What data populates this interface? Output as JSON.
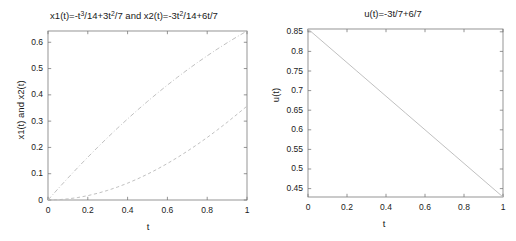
{
  "figure": {
    "background": "#ffffff",
    "axis_color": "#7a7a7a",
    "curve_color": "#b9b9b9",
    "text_color": "#1a1a1a"
  },
  "chart_data": [
    {
      "type": "line",
      "panel": "left",
      "title": "x1(t)=-t^3/14+3t^2/7 and x2(t)=-3t^2/14+6t/7",
      "title_parts": {
        "seg1": "x1(t)=-t",
        "sup1": "3",
        "seg2": "/14+3t",
        "sup2": "2",
        "seg3": "/7 and x2(t)=-3t",
        "sup3": "2",
        "seg4": "/14+6t/7"
      },
      "xlabel": "t",
      "ylabel": "x1(t) and x2(t)",
      "xlim": [
        0,
        1
      ],
      "ylim": [
        0,
        0.642857
      ],
      "xticks": [
        0,
        0.2,
        0.4,
        0.6,
        0.8,
        1
      ],
      "xticklabels": [
        "0",
        "0.2",
        "0.4",
        "0.6",
        "0.8",
        "1"
      ],
      "yticks": [
        0,
        0.1,
        0.2,
        0.3,
        0.4,
        0.5,
        0.6
      ],
      "yticklabels": [
        "0",
        "0.1",
        "0.2",
        "0.3",
        "0.4",
        "0.5",
        "0.6"
      ],
      "grid": false,
      "legend": null,
      "series": [
        {
          "name": "x1(t)=-t^3/14+3t^2/7",
          "style": "dashed",
          "x": [
            0,
            0.05,
            0.1,
            0.15,
            0.2,
            0.25,
            0.3,
            0.35,
            0.4,
            0.45,
            0.5,
            0.55,
            0.6,
            0.65,
            0.7,
            0.75,
            0.8,
            0.85,
            0.9,
            0.95,
            1
          ],
          "values": [
            0,
            0.00107,
            0.00421,
            0.0094,
            0.01657,
            0.02567,
            0.03664,
            0.04944,
            0.064,
            0.08027,
            0.09821,
            0.11775,
            0.13886,
            0.16147,
            0.18554,
            0.21101,
            0.23783,
            0.26596,
            0.29533,
            0.3259,
            0.35714
          ]
        },
        {
          "name": "x2(t)=-3t^2/14+6t/7",
          "style": "dash-dot",
          "x": [
            0,
            0.05,
            0.1,
            0.15,
            0.2,
            0.25,
            0.3,
            0.35,
            0.4,
            0.45,
            0.5,
            0.55,
            0.6,
            0.65,
            0.7,
            0.75,
            0.8,
            0.85,
            0.9,
            0.95,
            1
          ],
          "values": [
            0,
            0.04232,
            0.08357,
            0.12375,
            0.16286,
            0.20089,
            0.23786,
            0.27375,
            0.30857,
            0.34232,
            0.375,
            0.40661,
            0.43714,
            0.46661,
            0.495,
            0.52232,
            0.54857,
            0.57375,
            0.59786,
            0.62089,
            0.64286
          ]
        }
      ]
    },
    {
      "type": "line",
      "panel": "right",
      "title": "u(t)=-3t/7+6/7",
      "xlabel": "t",
      "ylabel": "u(t)",
      "xlim": [
        0,
        1
      ],
      "ylim": [
        0.428571,
        0.857143
      ],
      "xticks": [
        0,
        0.2,
        0.4,
        0.6,
        0.8,
        1
      ],
      "xticklabels": [
        "0",
        "0.2",
        "0.4",
        "0.6",
        "0.8",
        "1"
      ],
      "yticks": [
        0.45,
        0.5,
        0.55,
        0.6,
        0.65,
        0.7,
        0.75,
        0.8,
        0.85
      ],
      "yticklabels": [
        "0.45",
        "0.5",
        "0.55",
        "0.6",
        "0.65",
        "0.7",
        "0.75",
        "0.8",
        "0.85"
      ],
      "grid": false,
      "legend": null,
      "series": [
        {
          "name": "u(t)=-3t/7+6/7",
          "style": "solid",
          "x": [
            0,
            0.25,
            0.5,
            0.75,
            1
          ],
          "values": [
            0.857143,
            0.75,
            0.642857,
            0.535714,
            0.428571
          ]
        }
      ]
    }
  ]
}
